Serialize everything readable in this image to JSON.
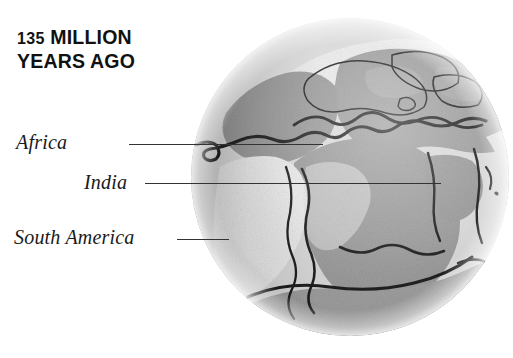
{
  "figure": {
    "kind": "globe-diagram",
    "background_color": "#ffffff"
  },
  "title": {
    "number": "135",
    "line1_rest": " MILLION",
    "line2": "YEARS AGO",
    "full_text": "135 MILLION YEARS AGO",
    "color": "#111111"
  },
  "labels": [
    {
      "id": "africa",
      "text": "Africa",
      "leader_from_x": 129,
      "leader_to_x": 323,
      "leader_y": 144
    },
    {
      "id": "india",
      "text": "India",
      "leader_from_x": 145,
      "leader_to_x": 441,
      "leader_y": 183
    },
    {
      "id": "south_america",
      "text": "South America",
      "leader_from_x": 177,
      "leader_to_x": 229,
      "leader_y": 239
    }
  ],
  "globe": {
    "center_x": 350,
    "center_y": 178,
    "radius": 160,
    "colors": {
      "ocean_light": "#d9d9d9",
      "ocean_pale": "#e6e6e6",
      "land_mid": "#9b9b9b",
      "land_dark": "#8a8a8a",
      "land_light": "#efefef",
      "rim_light": "#e9e9e9",
      "coastline": "#1c1c1c",
      "shadow": "#7f7f7f"
    },
    "landmasses": [
      "Africa",
      "India",
      "South America",
      "North America",
      "Eurasia",
      "Antarctica"
    ]
  }
}
